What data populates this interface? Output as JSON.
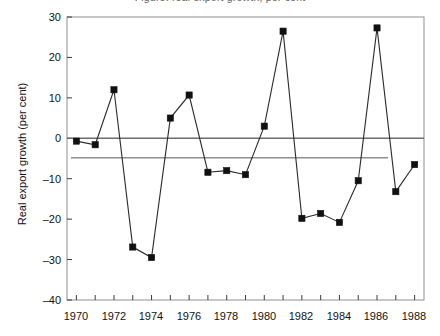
{
  "title_sliver": "Figure: real export growth, per cent",
  "axis": {
    "ylabel": "Real export growth (per cent)",
    "xlabel": "",
    "yticks": [
      30,
      20,
      10,
      0,
      -10,
      -20,
      -30,
      -40
    ],
    "ytick_labels": [
      "30",
      "20",
      "10",
      "0",
      "–10",
      "–20",
      "–30",
      "–40"
    ],
    "xtick_labels": [
      "1970",
      "1972",
      "1974",
      "1976",
      "1978",
      "1980",
      "1982",
      "1984",
      "1986",
      "1988"
    ]
  },
  "reference_lines": [
    {
      "name": "zero-line",
      "value": 0,
      "color": "#6d6d6d"
    },
    {
      "name": "mean-line",
      "value": -4.8,
      "color": "#8e8e8e"
    }
  ],
  "chart_data": {
    "type": "line",
    "title": "",
    "xlabel": "",
    "ylabel": "Real export growth (per cent)",
    "xlim": [
      1969.5,
      1988.5
    ],
    "ylim": [
      -40,
      30
    ],
    "grid": false,
    "legend": null,
    "marker": "filled-square",
    "x": [
      1970,
      1971,
      1972,
      1973,
      1974,
      1975,
      1976,
      1977,
      1978,
      1979,
      1980,
      1981,
      1982,
      1983,
      1984,
      1985,
      1986,
      1987,
      1988
    ],
    "categories": [
      "1970",
      "1971",
      "1972",
      "1973",
      "1974",
      "1975",
      "1976",
      "1977",
      "1978",
      "1979",
      "1980",
      "1981",
      "1982",
      "1983",
      "1984",
      "1985",
      "1986",
      "1987",
      "1988"
    ],
    "values": [
      -0.7,
      -1.6,
      12.0,
      -26.9,
      -29.5,
      5.0,
      10.7,
      -8.4,
      -8.0,
      -9.0,
      3.0,
      26.5,
      -19.8,
      -18.6,
      -20.8,
      -10.5,
      27.3,
      -13.2,
      -6.5
    ],
    "series": [
      {
        "name": "Real export growth",
        "values": [
          -0.7,
          -1.6,
          12.0,
          -26.9,
          -29.5,
          5.0,
          10.7,
          -8.4,
          -8.0,
          -9.0,
          3.0,
          26.5,
          -19.8,
          -18.6,
          -20.8,
          -10.5,
          27.3,
          -13.2,
          -6.5
        ]
      }
    ],
    "annotations": [
      {
        "name": "zero-reference",
        "type": "hline",
        "y": 0
      },
      {
        "name": "mean-reference",
        "type": "hline",
        "y": -4.8
      }
    ]
  }
}
